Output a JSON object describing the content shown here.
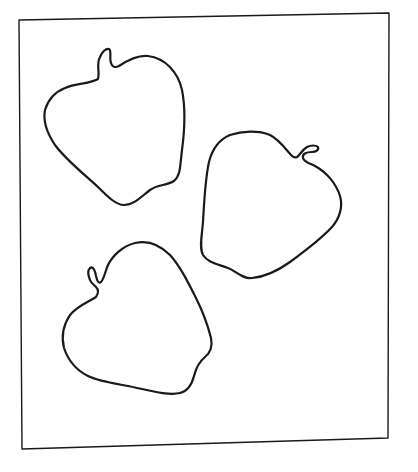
{
  "drawing": {
    "description": "Line drawing of three apple outlines inside a slightly skewed rectangular frame",
    "background_color": "#ffffff",
    "stroke_color": "#1a1a1a",
    "frame": {
      "corners": [
        [
          19,
          20
        ],
        [
          389,
          13
        ],
        [
          388,
          438
        ],
        [
          22,
          449
        ]
      ],
      "stroke_width": 1.4
    },
    "shapes": [
      {
        "name": "apple-top-left",
        "stem_direction": "up"
      },
      {
        "name": "apple-middle-right",
        "stem_direction": "right"
      },
      {
        "name": "apple-bottom-left",
        "stem_direction": "left"
      }
    ]
  }
}
